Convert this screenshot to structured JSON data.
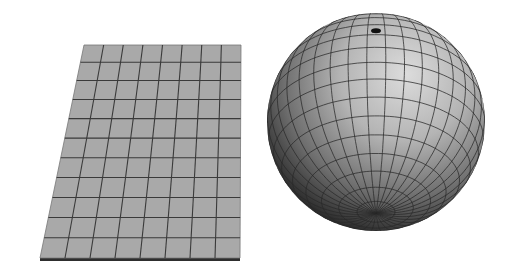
{
  "figure": {
    "background": "#ffffff",
    "objects": [
      {
        "name": "flat-grid-plane",
        "type": "plane",
        "fill": "#a9a9a9",
        "line_color": "#3a3a3a",
        "edge_color": "#2e2e2e",
        "corners": {
          "top_left": [
            84,
            45
          ],
          "top_right": [
            241,
            45
          ],
          "bottom_right": [
            240,
            258
          ],
          "bottom_left": [
            40,
            258
          ]
        },
        "columns": 8,
        "rows": 11
      },
      {
        "name": "grid-sphere",
        "type": "sphere",
        "center": [
          376,
          122
        ],
        "radius": 109,
        "pole": [
          386,
          30
        ],
        "highlight_color": "#d8d8d8",
        "shadow_color": "#111111",
        "line_color": "#2a2a2a",
        "meridians": 36,
        "parallels": 18
      }
    ]
  }
}
